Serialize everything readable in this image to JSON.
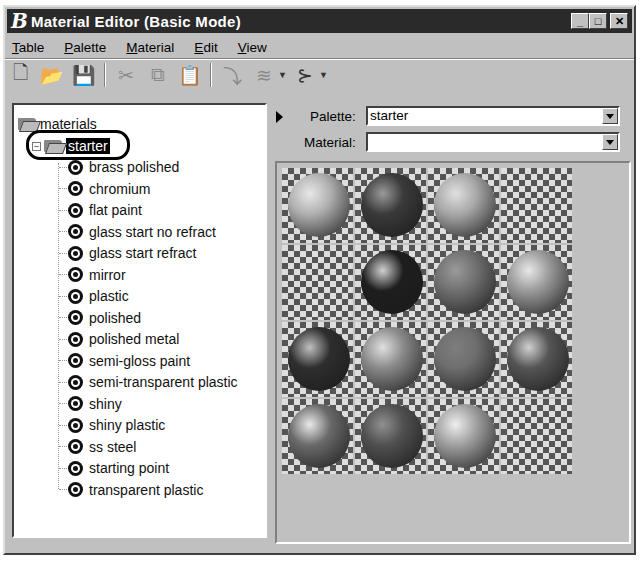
{
  "window": {
    "logo": "B",
    "title": "Material Editor (Basic Mode)",
    "controls": {
      "minimize": "_",
      "maximize": "□",
      "close": "✕"
    }
  },
  "menu": [
    {
      "label": "Table",
      "mnemonic": "T",
      "rest": "able"
    },
    {
      "label": "Palette",
      "mnemonic": "P",
      "rest": "alette"
    },
    {
      "label": "Material",
      "mnemonic": "M",
      "rest": "aterial"
    },
    {
      "label": "Edit",
      "mnemonic": "E",
      "rest": "dit"
    },
    {
      "label": "View",
      "mnemonic": "V",
      "rest": "iew"
    }
  ],
  "toolbar": {
    "icons": [
      "new-icon",
      "open-folder-icon",
      "save-icon",
      "cut-icon",
      "copy-icon",
      "paste-icon",
      "assign-icon",
      "stack-icon",
      "connect-icon"
    ],
    "glyphs": {
      "new": "🗋",
      "open": "📂",
      "save": "💾",
      "cut": "✂",
      "copy": "⧉",
      "paste": "📋",
      "assign": "⤵",
      "stack": "≋",
      "connect": "⊱"
    }
  },
  "tree": {
    "root": "materials",
    "selected_palette": "starter",
    "expander": "−",
    "items": [
      "brass polished",
      "chromium",
      "flat paint",
      "glass start no refract",
      "glass start refract",
      "mirror",
      "plastic",
      "polished",
      "polished metal",
      "semi-gloss paint",
      "semi-transparent plastic",
      "shiny",
      "shiny plastic",
      "ss steel",
      "starting point",
      "transparent plastic"
    ]
  },
  "right": {
    "palette_label": "Palette:",
    "palette_mnemonic": "l",
    "palette_value": "starter",
    "material_label": "Material:",
    "material_value": ""
  },
  "preview": {
    "spheres": [
      {
        "row": 0,
        "col": 0,
        "color": "#b0b0b0",
        "hl": "#e8e8e8"
      },
      {
        "row": 0,
        "col": 1,
        "color": "#3a3a3a",
        "hl": "#9a9a9a"
      },
      {
        "row": 0,
        "col": 2,
        "color": "#a8a8a8",
        "hl": "#e0e0e0"
      },
      {
        "row": 0,
        "col": 3,
        "color": null
      },
      {
        "row": 1,
        "col": 0,
        "color": null
      },
      {
        "row": 1,
        "col": 1,
        "color": "#1e1e1e",
        "hl": "#d0d0d0"
      },
      {
        "row": 1,
        "col": 2,
        "color": "#707070",
        "hl": "#9a9a9a"
      },
      {
        "row": 1,
        "col": 3,
        "color": "#9a9a9a",
        "hl": "#e8e8e8"
      },
      {
        "row": 2,
        "col": 0,
        "color": "#2e2e2e",
        "hl": "#c0c0c0"
      },
      {
        "row": 2,
        "col": 1,
        "color": "#8a8a8a",
        "hl": "#e0e0e0"
      },
      {
        "row": 2,
        "col": 2,
        "color": "#6e6e6e",
        "hl": "#7e7e7e"
      },
      {
        "row": 2,
        "col": 3,
        "color": "#555555",
        "hl": "#d0d0d0"
      },
      {
        "row": 3,
        "col": 0,
        "color": "#6a6a6a",
        "hl": "#eaeaea"
      },
      {
        "row": 3,
        "col": 1,
        "color": "#505050",
        "hl": "#909090"
      },
      {
        "row": 3,
        "col": 2,
        "color": "#a0a0a0",
        "hl": "#eeeeee"
      },
      {
        "row": 3,
        "col": 3,
        "color": null
      }
    ]
  }
}
